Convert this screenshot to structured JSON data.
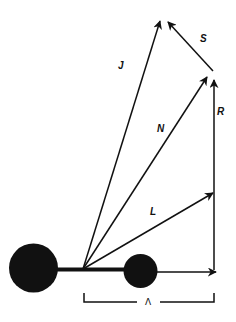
{
  "diagram": {
    "type": "vector-diagram",
    "colors": {
      "ink": "#111111",
      "background": "#ffffff"
    },
    "bodies": [
      {
        "name": "large-atom",
        "cx": 33.5,
        "cy": 268,
        "r": 24.5
      },
      {
        "name": "small-atom",
        "cx": 140.5,
        "cy": 271,
        "r": 17
      }
    ],
    "origin": {
      "x": 83,
      "y": 269
    },
    "vectors": [
      {
        "label": "J",
        "from": [
          83,
          269
        ],
        "to": [
          160,
          21
        ],
        "label_pos": [
          122,
          68
        ]
      },
      {
        "label": "N",
        "from": [
          83,
          269
        ],
        "to": [
          207,
          77
        ],
        "label_pos": [
          161,
          131
        ]
      },
      {
        "label": "L",
        "from": [
          83,
          269
        ],
        "to": [
          213,
          193
        ],
        "label_pos": [
          153,
          214
        ]
      },
      {
        "label": "R",
        "from": [
          214,
          269
        ],
        "to": [
          214,
          80
        ],
        "label_pos": [
          220,
          114
        ]
      },
      {
        "label": "S",
        "from": [
          213,
          71
        ],
        "to": [
          168,
          22
        ],
        "label_pos": [
          203,
          41
        ]
      },
      {
        "label": "",
        "from": [
          158,
          272
        ],
        "to": [
          216,
          272
        ]
      }
    ],
    "bracket": {
      "label": "Λ",
      "x1": 84,
      "x2": 214,
      "y_top": 293,
      "y_bottom": 302
    }
  }
}
